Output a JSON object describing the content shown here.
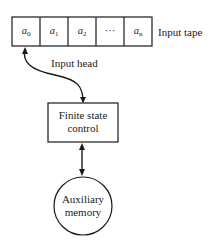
{
  "diagram": {
    "input_tape": {
      "label": "Input tape",
      "cells": [
        {
          "symbol": "a",
          "subscript": "0"
        },
        {
          "symbol": "a",
          "subscript": "1"
        },
        {
          "symbol": "a",
          "subscript": "2"
        },
        {
          "symbol": "···",
          "subscript": ""
        },
        {
          "symbol": "a",
          "subscript": "n"
        }
      ]
    },
    "input_head": {
      "label": "Input head"
    },
    "control": {
      "line1": "Finite state",
      "line2": "control"
    },
    "memory": {
      "line1": "Auxiliary",
      "line2": "memory"
    },
    "colors": {
      "stroke": "#1a1a1a",
      "background": "#ffffff"
    }
  }
}
